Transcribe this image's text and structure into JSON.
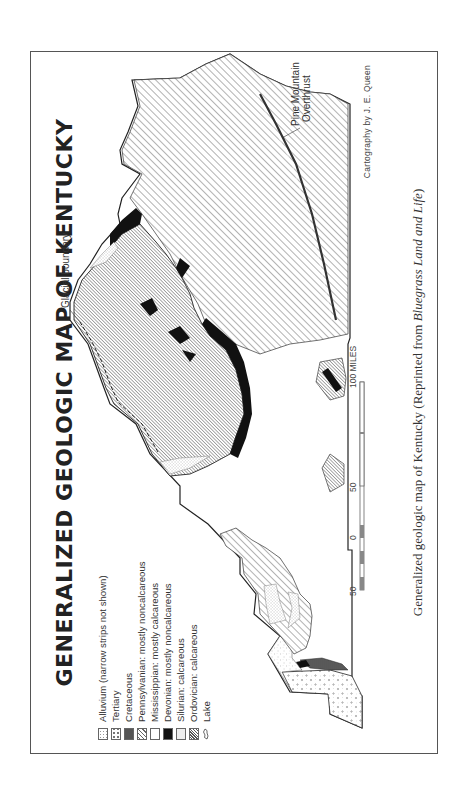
{
  "title": "GENERALIZED GEOLOGIC MAP OF KENTUCKY",
  "legend": {
    "items": [
      {
        "label": "Alluvium (narrow strips not shown)",
        "pattern": "alluvium"
      },
      {
        "label": "Tertiary",
        "pattern": "tertiary"
      },
      {
        "label": "Cretaceous",
        "pattern": "cretaceous"
      },
      {
        "label": "Pennsylvanian: mostly noncalcareous",
        "pattern": "pennsylvanian"
      },
      {
        "label": "Mississippian: mostly calcareous",
        "pattern": "mississippian"
      },
      {
        "label": "Devonian: mostly noncalcareous",
        "pattern": "devonian"
      },
      {
        "label": "Silurian: calcareous",
        "pattern": "silurian"
      },
      {
        "label": "Ordovician: calcareous",
        "pattern": "ordovician"
      },
      {
        "label": "Lake",
        "pattern": "lake-icon"
      }
    ]
  },
  "map_labels": {
    "glacial_boundary": "Glacial boundary",
    "pine_mountain_line1": "Pine Mountain",
    "pine_mountain_line2": "Overthrust"
  },
  "scale": {
    "ticks": [
      "50",
      "0",
      "50",
      "100 MILES"
    ]
  },
  "credit": "Cartography by J. E. Queen",
  "caption": {
    "prefix": "Generalized geologic map of Kentucky (Reprinted from ",
    "italic": "Bluegrass Land and Life",
    "suffix": ")"
  },
  "colors": {
    "ink": "#222222",
    "frame": "#555555",
    "paper": "#ffffff"
  }
}
